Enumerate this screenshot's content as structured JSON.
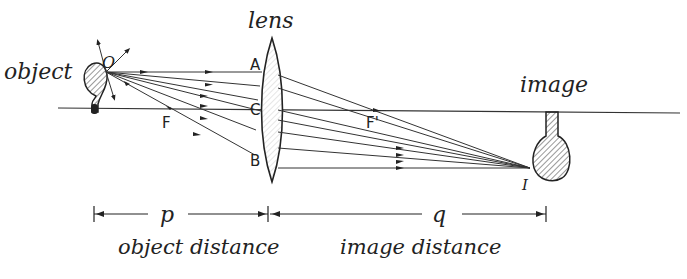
{
  "labels": {
    "object": "object",
    "lens": "lens",
    "image": "image",
    "point_O": "O",
    "point_A": "A",
    "point_C": "C",
    "point_B": "B",
    "focus_F": "F",
    "focus_F_prime": "F'",
    "point_I": "I",
    "p": "p",
    "q": "q",
    "object_distance": "object distance",
    "image_distance": "image distance"
  },
  "colors": {
    "ink": "#222222",
    "background": "#ffffff"
  }
}
